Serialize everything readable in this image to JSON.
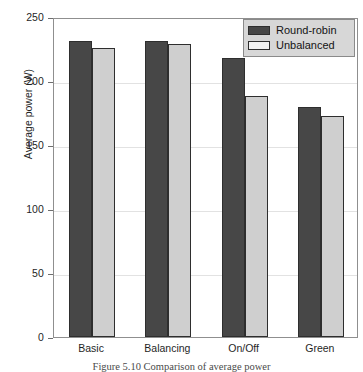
{
  "chart_data": {
    "type": "bar",
    "title": "",
    "xlabel": "",
    "ylabel": "Average power (W)",
    "categories": [
      "Basic",
      "Balancing",
      "On/Off",
      "Green"
    ],
    "series": [
      {
        "name": "Round-robin",
        "color": "#474747",
        "values": [
          231,
          231,
          218,
          180
        ]
      },
      {
        "name": "Unbalanced",
        "color": "#cfcfcf",
        "values": [
          226,
          229,
          188,
          173
        ]
      }
    ],
    "ylim": [
      0,
      250
    ],
    "yticks": [
      0,
      50,
      100,
      150,
      200,
      250
    ],
    "ytick_labels": [
      "0",
      "50",
      "100",
      "150",
      "200",
      "250"
    ],
    "grid": true,
    "grid_axis": "y",
    "legend_position": "upper right",
    "legend_entries": [
      "Round-robin",
      "Unbalanced"
    ]
  },
  "caption": {
    "text": "Figure 5.10   Comparison of average power"
  },
  "colors": {
    "series_dark": "#474747",
    "series_light": "#cfcfcf",
    "axis": "#8f8f8f",
    "grid": "#e2e2e2",
    "legend_background": "#d7d7d7",
    "text": "#1f1f1f"
  }
}
